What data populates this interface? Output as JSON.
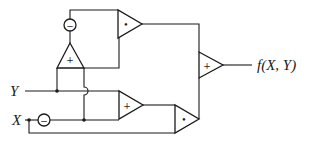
{
  "diagram": {
    "inputs": {
      "y_label": "Y",
      "x_label": "X"
    },
    "output_label": "f(X, Y)",
    "blocks": {
      "negate_top": {
        "type": "negation",
        "symbol": "−"
      },
      "negate_x": {
        "type": "negation",
        "symbol": "−"
      },
      "adder_vertical": {
        "type": "adder",
        "symbol": "+"
      },
      "multiplier_top": {
        "type": "multiplier",
        "symbol": "•"
      },
      "adder_middle": {
        "type": "adder",
        "symbol": "+"
      },
      "multiplier_bottom": {
        "type": "multiplier",
        "symbol": "•"
      },
      "adder_output": {
        "type": "adder",
        "symbol": "+"
      }
    },
    "colors": {
      "stroke": "#1a1a1a",
      "background": "#ffffff"
    }
  }
}
